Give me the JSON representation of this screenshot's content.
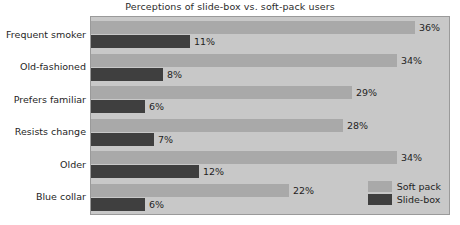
{
  "chart_data": {
    "type": "bar",
    "orientation": "horizontal",
    "title": "Perceptions of slide-box vs. soft-pack users",
    "xlabel": "",
    "ylabel": "",
    "xlim": [
      0,
      40
    ],
    "grid": false,
    "legend_position": "bottom-right",
    "categories": [
      "Frequent smoker",
      "Old-fashioned",
      "Prefers familiar",
      "Resists change",
      "Older",
      "Blue collar"
    ],
    "series": [
      {
        "name": "Soft pack",
        "color": "#a9a9a9",
        "values": [
          36,
          34,
          29,
          28,
          34,
          22
        ],
        "labels": [
          "36%",
          "34%",
          "29%",
          "28%",
          "34%",
          "22%"
        ]
      },
      {
        "name": "Slide-box",
        "color": "#3f3f3f",
        "values": [
          11,
          8,
          6,
          7,
          12,
          6
        ],
        "labels": [
          "11%",
          "8%",
          "6%",
          "7%",
          "12%",
          "6%"
        ]
      }
    ]
  },
  "legend": {
    "items": [
      {
        "label": "Soft pack",
        "color": "#a9a9a9"
      },
      {
        "label": "Slide-box",
        "color": "#3f3f3f"
      }
    ]
  },
  "style": {
    "plot_background": "#c8c8c8",
    "page_background": "#ffffff",
    "frame_color": "#9a9a9a",
    "text_color": "#1f1f1f"
  }
}
